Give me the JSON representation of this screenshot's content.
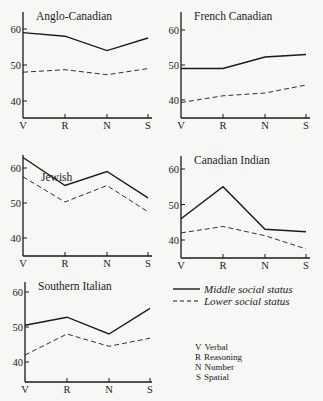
{
  "chart_data": [
    {
      "type": "line",
      "title": "Anglo-Canadian",
      "categories": [
        "V",
        "R",
        "N",
        "S"
      ],
      "ylim": [
        35,
        64
      ],
      "yticks": [
        40,
        50,
        60
      ],
      "series": [
        {
          "name": "Middle social status",
          "style": "solid",
          "values": [
            59,
            58,
            54,
            57.5
          ]
        },
        {
          "name": "Lower social status",
          "style": "dashed",
          "values": [
            48,
            48.7,
            47.3,
            49
          ]
        }
      ]
    },
    {
      "type": "line",
      "title": "French Canadian",
      "categories": [
        "V",
        "R",
        "N",
        "S"
      ],
      "ylim": [
        35,
        64
      ],
      "yticks": [
        40,
        50,
        60
      ],
      "series": [
        {
          "name": "Middle social status",
          "style": "solid",
          "values": [
            49,
            49,
            52.3,
            53
          ]
        },
        {
          "name": "Lower social status",
          "style": "dashed",
          "values": [
            39.3,
            41.2,
            42,
            44.3
          ]
        }
      ]
    },
    {
      "type": "line",
      "title": "Jewish",
      "categories": [
        "V",
        "R",
        "N",
        "S"
      ],
      "ylim": [
        35,
        64
      ],
      "yticks": [
        40,
        50,
        60
      ],
      "series": [
        {
          "name": "Middle social status",
          "style": "solid",
          "values": [
            63,
            55,
            59,
            51.5
          ]
        },
        {
          "name": "Lower social status",
          "style": "dashed",
          "values": [
            57.5,
            50.3,
            55,
            47.5
          ]
        }
      ]
    },
    {
      "type": "line",
      "title": "Canadian Indian",
      "categories": [
        "V",
        "R",
        "N",
        "S"
      ],
      "ylim": [
        35,
        64
      ],
      "yticks": [
        40,
        50,
        60
      ],
      "series": [
        {
          "name": "Middle social status",
          "style": "solid",
          "values": [
            46,
            55,
            43,
            42.3
          ]
        },
        {
          "name": "Lower social status",
          "style": "dashed",
          "values": [
            42,
            43.8,
            41.2,
            37.5
          ]
        }
      ]
    },
    {
      "type": "line",
      "title": "Southern Italian",
      "categories": [
        "V",
        "R",
        "N",
        "S"
      ],
      "ylim": [
        35,
        64
      ],
      "yticks": [
        40,
        50,
        60
      ],
      "series": [
        {
          "name": "Middle social status",
          "style": "solid",
          "values": [
            50.5,
            52.8,
            48,
            55.3
          ]
        },
        {
          "name": "Lower social status",
          "style": "dashed",
          "values": [
            42,
            48,
            44.5,
            46.8
          ]
        }
      ]
    }
  ],
  "legend": {
    "placement": "bottom-right",
    "entries": [
      {
        "sample": "——",
        "label": "Middle social status",
        "style": "solid"
      },
      {
        "sample": "- - - -",
        "label": "Lower social status",
        "style": "dashed"
      }
    ]
  },
  "key": [
    {
      "abbr": "V",
      "label": "Verbal"
    },
    {
      "abbr": "R",
      "label": "Reasoning"
    },
    {
      "abbr": "N",
      "label": "Number"
    },
    {
      "abbr": "S",
      "label": "Spatial"
    }
  ],
  "colors": {
    "ink": "#1a1a1a",
    "paper": "#f7f7f5"
  }
}
